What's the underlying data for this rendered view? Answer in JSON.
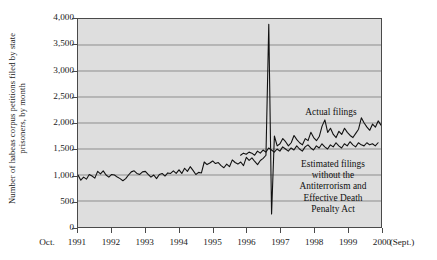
{
  "chart_data": {
    "type": "line",
    "title": "",
    "xlabel": "",
    "ylabel": "Number of habeas corpus petitions filed by state prisoners, by month",
    "ylabel_lines": [
      "Number of habeas corpus petitions filed by state",
      "prisoners, by month"
    ],
    "ylim": [
      0,
      4000
    ],
    "ytick_labels": [
      "0",
      "500",
      "1,000",
      "1,500",
      "2,000",
      "2,500",
      "3,000",
      "3,500",
      "4,000"
    ],
    "ytick_values": [
      0,
      500,
      1000,
      1500,
      2000,
      2500,
      3000,
      3500,
      4000
    ],
    "xlim": [
      1991.75,
      2000.75
    ],
    "x_start_label": "Oct.",
    "x_end_label": "(Sept.)",
    "xtick_labels": [
      "1991",
      "1992",
      "1993",
      "1994",
      "1995",
      "1996",
      "1997",
      "1998",
      "1999",
      "2000"
    ],
    "xtick_values": [
      1991.75,
      1992.75,
      1993.75,
      1994.75,
      1995.75,
      1996.75,
      1997.75,
      1998.75,
      1999.75,
      2000.75
    ],
    "grid": "horizontal",
    "legend_position": "inline-annotation",
    "annotations": [
      {
        "name": "actual-filings",
        "text": "Actual filings",
        "lines": [
          "Actual filings"
        ]
      },
      {
        "name": "estimated-filings",
        "text": "Estimated filings without the Antiterrorism and Effective Death Penalty Act",
        "lines": [
          "Estimated filings",
          "without the",
          "Antiterrorism and",
          "Effective Death",
          "Penalty Act"
        ]
      }
    ],
    "colors": {
      "line": "#111111",
      "panel_background": "#dedede",
      "gridline": "#8d8d8d",
      "axis": "#4a4a4a",
      "page_background": "#ffffff"
    },
    "series": [
      {
        "name": "Actual filings",
        "x_start": 1991.75,
        "x_step": 0.08333,
        "values": [
          1000,
          900,
          960,
          920,
          1010,
          980,
          940,
          1070,
          1020,
          1080,
          1000,
          960,
          1010,
          1000,
          960,
          930,
          890,
          930,
          1000,
          1060,
          1080,
          1030,
          1010,
          1060,
          1070,
          1010,
          960,
          1000,
          930,
          1010,
          1030,
          980,
          1040,
          1030,
          1080,
          1030,
          1100,
          1030,
          1130,
          1070,
          1160,
          1090,
          1010,
          1050,
          1040,
          1250,
          1200,
          1230,
          1270,
          1220,
          1240,
          1180,
          1140,
          1210,
          1160,
          1290,
          1240,
          1210,
          1250,
          1180,
          1340,
          1280,
          1330,
          1260,
          1200,
          1280,
          1320,
          1380,
          3900,
          250,
          1750,
          1560,
          1600,
          1700,
          1640,
          1560,
          1620,
          1760,
          1680,
          1620,
          1580,
          1700,
          1660,
          1820,
          1720,
          1660,
          1740,
          1940,
          2060,
          1820,
          1900,
          1780,
          1720,
          1840,
          1780,
          1900,
          1820,
          1760,
          1720,
          1800,
          1880,
          2100,
          2000,
          1920,
          1860,
          1980,
          1920,
          2040,
          1960,
          2060,
          1900,
          1820,
          1880,
          1840
        ]
      },
      {
        "name": "Estimated filings without the Antiterrorism and Effective Death Penalty Act",
        "x_start": 1996.58,
        "x_step": 0.08333,
        "values": [
          1380,
          1420,
          1400,
          1440,
          1420,
          1380,
          1460,
          1420,
          1480,
          1440,
          1520,
          1480,
          1440,
          1500,
          1460,
          1540,
          1500,
          1460,
          1520,
          1480,
          1560,
          1500,
          1460,
          1540,
          1580,
          1520,
          1480,
          1560,
          1520,
          1600,
          1540,
          1500,
          1580,
          1540,
          1620,
          1560,
          1520,
          1600,
          1560,
          1640,
          1580,
          1540,
          1620,
          1580,
          1560,
          1620,
          1580,
          1600,
          1560,
          1620
        ]
      }
    ]
  }
}
